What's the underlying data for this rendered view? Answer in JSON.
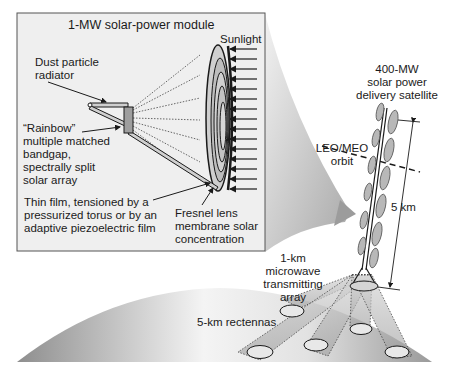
{
  "inset": {
    "title": "1-MW solar-power module",
    "sunlight": "Sunlight",
    "dust_radiator": "Dust particle\nradiator",
    "rainbow": "“Rainbow”\nmultiple matched\nbandgap,\nspectrally split\nsolar array",
    "thin_film": "Thin film, tensioned by a\npressurized torus or by an\nadaptive piezoelectric film",
    "fresnel": "Fresnel lens\nmembrane solar\nconcentration"
  },
  "satellite": {
    "label": "400-MW\nsolar power\ndelivery satellite",
    "orbit": "LEO/MEO\norbit",
    "length": "5 km"
  },
  "ground": {
    "transmitter": "1-km\nmicrowave\ntransmitting\narray",
    "rectennas": "5-km rectennas"
  },
  "colors": {
    "inset_bg": "#efefef",
    "callout": "#c8c8c8",
    "earth_dark": "#8e8e8e",
    "earth_light": "#f2f2f2",
    "panel": "#b8b8b8",
    "line": "#1a1a1a"
  }
}
